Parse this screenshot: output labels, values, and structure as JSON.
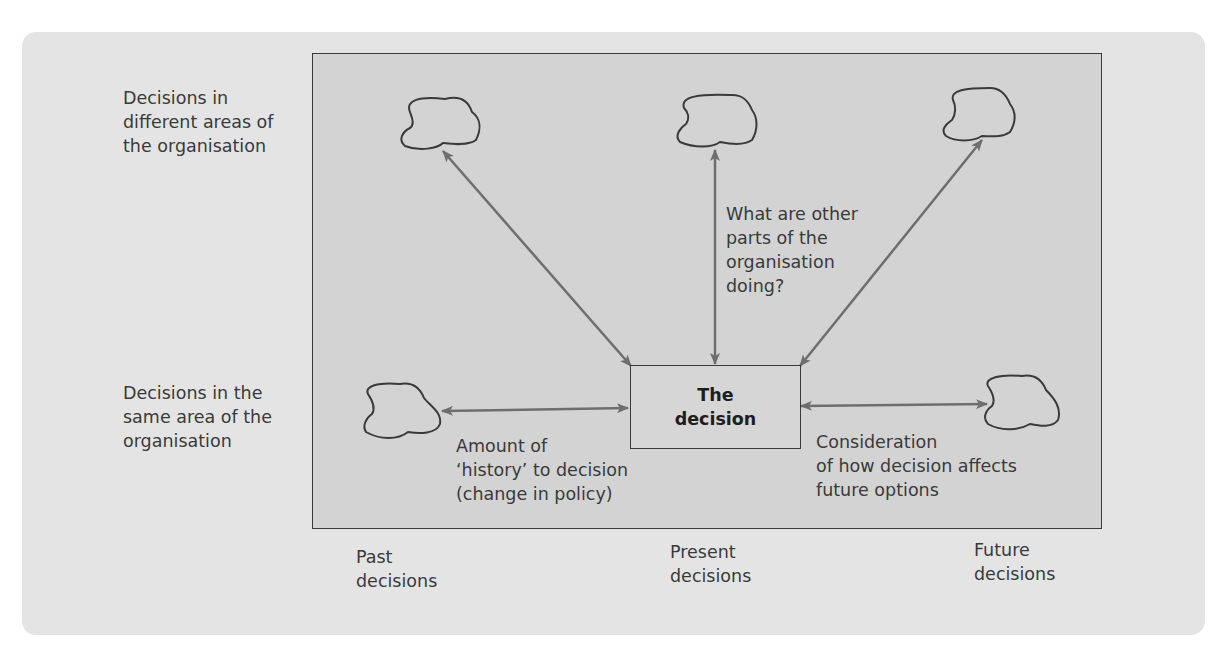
{
  "row_labels": {
    "different_areas": "Decisions in\ndifferent areas of\nthe organisation",
    "same_area": "Decisions in the\nsame area of the\norganisation"
  },
  "column_labels": {
    "past": "Past\ndecisions",
    "present": "Present\ndecisions",
    "future": "Future\ndecisions"
  },
  "center_node": {
    "label": "The\ndecision"
  },
  "annotations": {
    "other_parts": "What are other\nparts of the\norganisation\ndoing?",
    "history": "Amount of\n‘history’ to decision\n(change in policy)",
    "future_options": "Consideration\nof how decision affects\nfuture options"
  },
  "nodes": [
    {
      "id": "top-left-cloud",
      "shape": "cloud"
    },
    {
      "id": "top-center-cloud",
      "shape": "cloud"
    },
    {
      "id": "top-right-cloud",
      "shape": "cloud"
    },
    {
      "id": "left-cloud",
      "shape": "cloud"
    },
    {
      "id": "right-cloud",
      "shape": "cloud"
    }
  ],
  "edges": [
    {
      "from": "top-left-cloud",
      "to": "The decision",
      "type": "bidirectional"
    },
    {
      "from": "top-center-cloud",
      "to": "The decision",
      "type": "bidirectional"
    },
    {
      "from": "top-right-cloud",
      "to": "The decision",
      "type": "bidirectional"
    },
    {
      "from": "left-cloud",
      "to": "The decision",
      "type": "bidirectional"
    },
    {
      "from": "The decision",
      "to": "right-cloud",
      "type": "bidirectional"
    }
  ],
  "colors": {
    "panel": "#e4e4e4",
    "inner": "#d3d3d3",
    "arrow": "#6e6e6e",
    "outline": "#3a3a3a"
  }
}
